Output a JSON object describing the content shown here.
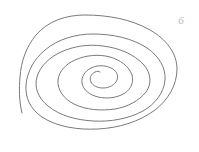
{
  "canvas": {
    "width": 199,
    "height": 152,
    "background_color": "#ffffff",
    "title": "Spiral Drawing"
  },
  "drawing": {
    "name": "hand-drawn-spiral",
    "description": "Hand-drawn pencil spiral, counter-clockwise inward, roughly elliptical",
    "stroke_color": "#7a7a7a",
    "stroke_width": 1,
    "turns": 4,
    "center_x": 97,
    "center_y": 73,
    "outer_end_x": 22,
    "outer_end_y": 113,
    "inner_end_x": 99,
    "inner_end_y": 72,
    "bounds": {
      "left": 19,
      "top": 15,
      "right": 178,
      "bottom": 129
    },
    "path": "M 22 113 C 19 101 19 88 20 77 C 21 62 26 47 36 35 C 48 21 66 15 85 15 C 107 15 131 19 150 30 C 166 39 177 53 177 69 C 177 85 168 100 155 110 C 139 122 118 128 98 129 C 78 130 57 127 42 117 C 30 109 25 97 26 85 C 27 72 34 59 45 50 C 58 39 76 34 93 34 C 112 34 132 38 147 48 C 159 56 166 68 165 80 C 164 93 155 104 143 111 C 128 119 110 122 93 121 C 77 120 60 116 48 106 C 38 98 34 87 37 77 C 40 66 50 57 61 52 C 74 46 89 44 103 46 C 119 48 134 54 144 65 C 151 73 152 84 146 92 C 139 101 127 107 115 109 C 101 111 86 110 74 104 C 64 99 57 90 58 80 C 59 71 66 64 75 60 C 86 55 99 54 110 57 C 120 60 129 66 132 75 C 134 82 131 89 125 93 C 117 98 107 99 98 97 C 90 95 83 90 82 83 C 81 77 85 71 91 68 C 97 65 105 65 111 68 C 116 70 119 75 117 80 C 115 85 109 88 103 88 C 98 88 93 86 91 82 C 89 78 91 74 95 72 C 97 71 99 71 100 72"
  },
  "annotation": {
    "name": "corner-pencil-mark",
    "text": "6",
    "color": "#b9b9b9",
    "x": 178,
    "y": 20
  }
}
